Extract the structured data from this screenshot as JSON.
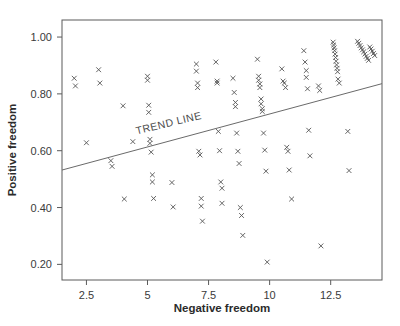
{
  "chart_data": {
    "type": "scatter",
    "title": "",
    "xlabel": "Negative freedom",
    "ylabel": "Positive freedom",
    "xlim": [
      1.5,
      14.6
    ],
    "ylim": [
      0.145,
      1.06
    ],
    "xticks": [
      2.5,
      5,
      7.5,
      10,
      12.5
    ],
    "xticklabels": [
      "2.5",
      "5",
      "7.5",
      "10",
      "12.5"
    ],
    "yticks": [
      0.2,
      0.4,
      0.6,
      0.8,
      1.0
    ],
    "yticklabels": [
      "0.20",
      "0.40",
      "0.60",
      "0.80",
      "1.00"
    ],
    "grid": false,
    "legend": null,
    "marker": "x",
    "marker_color": "#555555",
    "annotations": [
      {
        "text": "TREND LINE",
        "x": 5.9,
        "y": 0.685,
        "rotation": -13.5
      }
    ],
    "trend_line": {
      "label": "TREND LINE",
      "x_start": 1.5,
      "y_start": 0.532,
      "x_end": 14.6,
      "y_end": 0.836,
      "color": "#6a6a6a"
    },
    "points": [
      {
        "x": 2.0,
        "y": 0.855
      },
      {
        "x": 2.05,
        "y": 0.828
      },
      {
        "x": 2.5,
        "y": 0.628
      },
      {
        "x": 3.0,
        "y": 0.885
      },
      {
        "x": 3.05,
        "y": 0.838
      },
      {
        "x": 3.5,
        "y": 0.565
      },
      {
        "x": 3.55,
        "y": 0.545
      },
      {
        "x": 4.0,
        "y": 0.758
      },
      {
        "x": 4.05,
        "y": 0.43
      },
      {
        "x": 4.4,
        "y": 0.632
      },
      {
        "x": 5.0,
        "y": 0.862
      },
      {
        "x": 5.0,
        "y": 0.848
      },
      {
        "x": 5.05,
        "y": 0.76
      },
      {
        "x": 5.05,
        "y": 0.735
      },
      {
        "x": 5.1,
        "y": 0.64
      },
      {
        "x": 5.1,
        "y": 0.626
      },
      {
        "x": 5.15,
        "y": 0.595
      },
      {
        "x": 5.2,
        "y": 0.515
      },
      {
        "x": 5.2,
        "y": 0.49
      },
      {
        "x": 5.25,
        "y": 0.432
      },
      {
        "x": 6.0,
        "y": 0.488
      },
      {
        "x": 6.05,
        "y": 0.402
      },
      {
        "x": 7.0,
        "y": 0.905
      },
      {
        "x": 7.0,
        "y": 0.88
      },
      {
        "x": 7.05,
        "y": 0.838
      },
      {
        "x": 7.05,
        "y": 0.822
      },
      {
        "x": 7.1,
        "y": 0.598
      },
      {
        "x": 7.15,
        "y": 0.585
      },
      {
        "x": 7.2,
        "y": 0.432
      },
      {
        "x": 7.2,
        "y": 0.405
      },
      {
        "x": 7.25,
        "y": 0.352
      },
      {
        "x": 7.8,
        "y": 0.912
      },
      {
        "x": 7.85,
        "y": 0.845
      },
      {
        "x": 7.85,
        "y": 0.838
      },
      {
        "x": 7.9,
        "y": 0.668
      },
      {
        "x": 7.95,
        "y": 0.6
      },
      {
        "x": 8.0,
        "y": 0.49
      },
      {
        "x": 8.05,
        "y": 0.468
      },
      {
        "x": 8.05,
        "y": 0.415
      },
      {
        "x": 8.5,
        "y": 0.855
      },
      {
        "x": 8.55,
        "y": 0.805
      },
      {
        "x": 8.6,
        "y": 0.77
      },
      {
        "x": 8.6,
        "y": 0.755
      },
      {
        "x": 8.65,
        "y": 0.662
      },
      {
        "x": 8.7,
        "y": 0.598
      },
      {
        "x": 8.75,
        "y": 0.555
      },
      {
        "x": 8.8,
        "y": 0.4
      },
      {
        "x": 8.85,
        "y": 0.372
      },
      {
        "x": 8.9,
        "y": 0.302
      },
      {
        "x": 9.5,
        "y": 0.922
      },
      {
        "x": 9.55,
        "y": 0.862
      },
      {
        "x": 9.55,
        "y": 0.848
      },
      {
        "x": 9.6,
        "y": 0.835
      },
      {
        "x": 9.6,
        "y": 0.822
      },
      {
        "x": 9.65,
        "y": 0.782
      },
      {
        "x": 9.65,
        "y": 0.765
      },
      {
        "x": 9.7,
        "y": 0.748
      },
      {
        "x": 9.7,
        "y": 0.738
      },
      {
        "x": 9.75,
        "y": 0.662
      },
      {
        "x": 9.8,
        "y": 0.602
      },
      {
        "x": 9.85,
        "y": 0.528
      },
      {
        "x": 9.9,
        "y": 0.208
      },
      {
        "x": 10.5,
        "y": 0.888
      },
      {
        "x": 10.55,
        "y": 0.845
      },
      {
        "x": 10.6,
        "y": 0.838
      },
      {
        "x": 10.65,
        "y": 0.822
      },
      {
        "x": 10.7,
        "y": 0.612
      },
      {
        "x": 10.75,
        "y": 0.598
      },
      {
        "x": 10.8,
        "y": 0.532
      },
      {
        "x": 10.9,
        "y": 0.43
      },
      {
        "x": 11.4,
        "y": 0.952
      },
      {
        "x": 11.45,
        "y": 0.912
      },
      {
        "x": 11.5,
        "y": 0.882
      },
      {
        "x": 11.5,
        "y": 0.858
      },
      {
        "x": 11.55,
        "y": 0.818
      },
      {
        "x": 11.6,
        "y": 0.672
      },
      {
        "x": 11.65,
        "y": 0.582
      },
      {
        "x": 12.0,
        "y": 0.828
      },
      {
        "x": 12.05,
        "y": 0.812
      },
      {
        "x": 12.1,
        "y": 0.265
      },
      {
        "x": 12.6,
        "y": 0.982
      },
      {
        "x": 12.62,
        "y": 0.972
      },
      {
        "x": 12.64,
        "y": 0.962
      },
      {
        "x": 12.66,
        "y": 0.952
      },
      {
        "x": 12.68,
        "y": 0.94
      },
      {
        "x": 12.7,
        "y": 0.928
      },
      {
        "x": 12.72,
        "y": 0.915
      },
      {
        "x": 12.74,
        "y": 0.902
      },
      {
        "x": 12.76,
        "y": 0.89
      },
      {
        "x": 12.78,
        "y": 0.878
      },
      {
        "x": 12.8,
        "y": 0.852
      },
      {
        "x": 12.85,
        "y": 0.838
      },
      {
        "x": 13.2,
        "y": 0.668
      },
      {
        "x": 13.25,
        "y": 0.53
      },
      {
        "x": 13.6,
        "y": 0.985
      },
      {
        "x": 13.65,
        "y": 0.978
      },
      {
        "x": 13.7,
        "y": 0.97
      },
      {
        "x": 13.75,
        "y": 0.962
      },
      {
        "x": 13.8,
        "y": 0.955
      },
      {
        "x": 13.85,
        "y": 0.948
      },
      {
        "x": 13.9,
        "y": 0.94
      },
      {
        "x": 13.95,
        "y": 0.932
      },
      {
        "x": 14.0,
        "y": 0.925
      },
      {
        "x": 14.05,
        "y": 0.918
      },
      {
        "x": 14.1,
        "y": 0.965
      },
      {
        "x": 14.15,
        "y": 0.958
      },
      {
        "x": 14.2,
        "y": 0.95
      },
      {
        "x": 14.25,
        "y": 0.942
      },
      {
        "x": 14.3,
        "y": 0.935
      }
    ]
  },
  "colors": {
    "frame": "#5a5a5a",
    "marker": "#555555",
    "trend": "#6a6a6a",
    "text": "#2b2b2b",
    "background": "#ffffff"
  }
}
